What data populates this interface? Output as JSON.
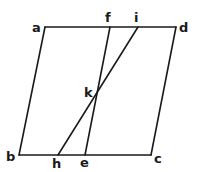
{
  "diagram": {
    "type": "geometric-figure",
    "shape": "parallelogram abcd with segments fe and ih crossing at k",
    "points": {
      "a": {
        "x": 45,
        "y": 27
      },
      "d": {
        "x": 176,
        "y": 27
      },
      "b": {
        "x": 19,
        "y": 155
      },
      "c": {
        "x": 151,
        "y": 155
      },
      "f": {
        "x": 110,
        "y": 27
      },
      "i": {
        "x": 138,
        "y": 27
      },
      "e": {
        "x": 85,
        "y": 155
      },
      "h": {
        "x": 58,
        "y": 155
      },
      "k": {
        "x": 97,
        "y": 94
      }
    },
    "segments": [
      {
        "from": "a",
        "to": "d"
      },
      {
        "from": "d",
        "to": "c"
      },
      {
        "from": "c",
        "to": "b"
      },
      {
        "from": "b",
        "to": "a"
      },
      {
        "from": "f",
        "to": "e"
      },
      {
        "from": "i",
        "to": "h"
      }
    ],
    "labels": {
      "a": "a",
      "b": "b",
      "c": "c",
      "d": "d",
      "e": "e",
      "f": "f",
      "h": "h",
      "i": "i",
      "k": "k"
    },
    "stroke_color": "#1a1a1a",
    "background": "#ffffff"
  }
}
